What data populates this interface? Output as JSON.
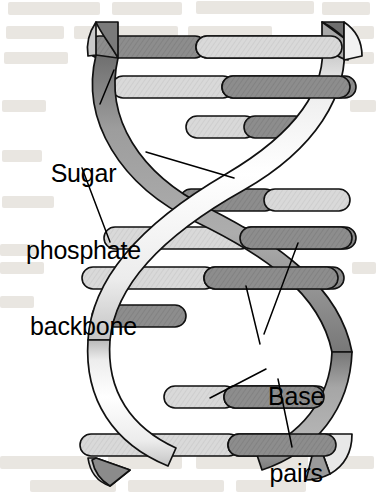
{
  "figure": {
    "name": "dna-double-helix-diagram",
    "width": 378,
    "height": 495,
    "background_color": "#ffffff"
  },
  "labels": {
    "sugar_backbone": {
      "line1": "Sugar",
      "line2": "phosphate",
      "line3": "backbone"
    },
    "base_pairs": {
      "line1": "Base",
      "line2": "pairs"
    }
  },
  "colors": {
    "ink": "#000000",
    "rung_light": "#d7d7d7",
    "rung_dark": "#8a8a8a",
    "ribbon_front_light": "#fbfbfb",
    "ribbon_front_mid": "#e3e3e3",
    "ribbon_back_dark": "#9a9a9a",
    "ribbon_back_darker": "#7e7e7e",
    "showthrough": "#cfc7bd"
  },
  "structure": {
    "backbone_count": 2,
    "base_pair_count": 11,
    "helix_turns": 2
  },
  "base_pairs": [
    {
      "index": 1,
      "y": 46,
      "x1": 92,
      "x2": 344,
      "split": 0.46,
      "left_tone": "dark",
      "right_tone": "light",
      "height": 21
    },
    {
      "index": 2,
      "y": 87,
      "x1": 115,
      "x2": 352,
      "split": 0.46,
      "left_tone": "light",
      "right_tone": "dark",
      "height": 20
    },
    {
      "index": 3,
      "y": 126,
      "x1": 190,
      "x2": 300,
      "split": 0.48,
      "left_tone": "light",
      "right_tone": "dark",
      "height": 20
    },
    {
      "index": 4,
      "y": 199,
      "x1": 185,
      "x2": 345,
      "split": 0.44,
      "left_tone": "dark",
      "right_tone": "light",
      "height": 21
    },
    {
      "index": 5,
      "y": 237,
      "x1": 108,
      "x2": 352,
      "split": 0.57,
      "left_tone": "light",
      "right_tone": "dark",
      "height": 21
    },
    {
      "index": 6,
      "y": 277,
      "x1": 86,
      "x2": 340,
      "split": 0.5,
      "left_tone": "light",
      "right_tone": "dark",
      "height": 21
    },
    {
      "index": 7,
      "y": 315,
      "x1": 96,
      "x2": 180,
      "split": 0.5,
      "left_tone": "dark",
      "right_tone": "dark",
      "height": 20
    },
    {
      "index": 8,
      "y": 396,
      "x1": 168,
      "x2": 290,
      "split": 0.47,
      "left_tone": "light",
      "right_tone": "dark",
      "height": 21
    },
    {
      "index": 9,
      "y": 444,
      "x1": 84,
      "x2": 330,
      "split": 0.5,
      "left_tone": "light",
      "right_tone": "dark",
      "height": 21
    }
  ],
  "leader_lines": {
    "sugar_backbone": [
      {
        "from": [
          100,
          104
        ],
        "to": [
          112,
          72
        ]
      },
      {
        "from": [
          145,
          152
        ],
        "to": [
          232,
          178
        ]
      },
      {
        "from": [
          82,
          168
        ],
        "to": [
          108,
          240
        ]
      }
    ],
    "base_pairs": [
      {
        "from": [
          264,
          334
        ],
        "to": [
          296,
          244
        ]
      },
      {
        "from": [
          262,
          344
        ],
        "to": [
          246,
          286
        ]
      },
      {
        "from": [
          266,
          368
        ],
        "to": [
          212,
          398
        ]
      },
      {
        "from": [
          276,
          378
        ],
        "to": [
          290,
          446
        ]
      }
    ]
  }
}
